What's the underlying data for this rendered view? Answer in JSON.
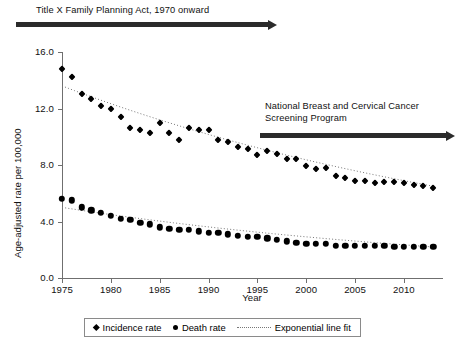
{
  "chart_data": {
    "type": "scatter",
    "title": "",
    "xlabel": "Year",
    "ylabel": "Age-adjusted rate per 100,000",
    "xlim": [
      1975,
      2014
    ],
    "ylim": [
      0.0,
      16.0
    ],
    "ytick_labels": [
      "0.0",
      "4.0",
      "8.0",
      "12.0",
      "16.0"
    ],
    "ytick_values": [
      0.0,
      4.0,
      8.0,
      12.0,
      16.0
    ],
    "xtick_labels": [
      "1975",
      "1980",
      "1985",
      "1990",
      "1995",
      "2000",
      "2005",
      "2010"
    ],
    "xtick_values": [
      1975,
      1980,
      1985,
      1990,
      1995,
      2000,
      2005,
      2010
    ],
    "grid": false,
    "legend_position": "bottom",
    "x": [
      1975,
      1976,
      1977,
      1978,
      1979,
      1980,
      1981,
      1982,
      1983,
      1984,
      1985,
      1986,
      1987,
      1988,
      1989,
      1990,
      1991,
      1992,
      1993,
      1994,
      1995,
      1996,
      1997,
      1998,
      1999,
      2000,
      2001,
      2002,
      2003,
      2004,
      2005,
      2006,
      2007,
      2008,
      2009,
      2010,
      2011,
      2012,
      2013
    ],
    "series": [
      {
        "name": "Incidence rate",
        "marker": "diamond",
        "values": [
          14.8,
          14.2,
          13.0,
          12.7,
          12.2,
          12.0,
          11.4,
          10.6,
          10.5,
          10.3,
          11.0,
          10.3,
          9.8,
          10.6,
          10.5,
          10.5,
          9.8,
          9.6,
          9.3,
          9.1,
          8.7,
          9.0,
          8.8,
          8.4,
          8.4,
          7.9,
          7.7,
          7.8,
          7.2,
          7.1,
          6.9,
          6.9,
          6.7,
          6.8,
          6.8,
          6.7,
          6.6,
          6.5,
          6.4
        ]
      },
      {
        "name": "Death rate",
        "marker": "circle",
        "values": [
          5.6,
          5.5,
          5.0,
          4.8,
          4.6,
          4.4,
          4.2,
          4.1,
          3.9,
          3.8,
          3.6,
          3.5,
          3.4,
          3.4,
          3.3,
          3.2,
          3.2,
          3.1,
          3.0,
          2.9,
          2.9,
          2.8,
          2.7,
          2.6,
          2.5,
          2.4,
          2.4,
          2.4,
          2.3,
          2.3,
          2.3,
          2.3,
          2.3,
          2.3,
          2.2,
          2.2,
          2.2,
          2.2,
          2.2
        ]
      }
    ],
    "fits": [
      {
        "name": "Exponential line fit",
        "applies_to": "Incidence rate",
        "style": "dotted",
        "start": {
          "x": 1975,
          "y": 13.6
        },
        "end": {
          "x": 2013,
          "y": 6.5
        }
      },
      {
        "name": "Exponential line fit",
        "applies_to": "Death rate",
        "style": "dotted",
        "start": {
          "x": 1975,
          "y": 5.0
        },
        "end": {
          "x": 2013,
          "y": 2.2
        }
      }
    ]
  },
  "annotations": [
    {
      "id": "title-x-act",
      "text": "Title X Family Planning Act, 1970 onward",
      "arrow": "right"
    },
    {
      "id": "nbccsp",
      "text": "National Breast and Cervical Cancer\nScreening Program",
      "arrow": "right"
    }
  ],
  "legend": {
    "items": [
      {
        "label": "Incidence rate",
        "marker": "diamond"
      },
      {
        "label": "Death rate",
        "marker": "circle"
      },
      {
        "label": "Exponential line fit",
        "marker": "dotted-line"
      }
    ]
  },
  "colors": {
    "marker": "#000000",
    "arrow": "#2b2b2b",
    "axis": "#6f6f6f",
    "fit_line": "#777777",
    "background": "#ffffff"
  }
}
